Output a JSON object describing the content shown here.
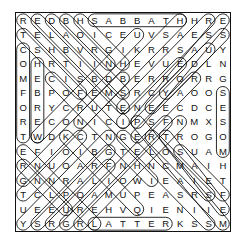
{
  "puzzle": {
    "type": "word-search",
    "rows": 15,
    "cols": 15,
    "grid": [
      [
        "R",
        "E",
        "D",
        "B",
        "H",
        "S",
        "A",
        "B",
        "B",
        "A",
        "T",
        "H",
        "H",
        "R",
        "E"
      ],
      [
        "T",
        "E",
        "L",
        "A",
        "O",
        "I",
        "C",
        "E",
        "U",
        "V",
        "S",
        "A",
        "E",
        "S",
        "S"
      ],
      [
        "C",
        "S",
        "H",
        "B",
        "V",
        "R",
        "G",
        "I",
        "K",
        "R",
        "R",
        "S",
        "A",
        "U",
        "Y"
      ],
      [
        "O",
        "H",
        "R",
        "T",
        "I",
        "I",
        "N",
        "H",
        "E",
        "V",
        "U",
        "E",
        "D",
        "L",
        "N"
      ],
      [
        "M",
        "E",
        "C",
        "I",
        "S",
        "B",
        "D",
        "B",
        "E",
        "R",
        "R",
        "O",
        "R",
        "R",
        "G"
      ],
      [
        "F",
        "B",
        "P",
        "O",
        "F",
        "E",
        "M",
        "S",
        "R",
        "C",
        "Y",
        "A",
        "O",
        "O",
        "S"
      ],
      [
        "O",
        "R",
        "Y",
        "C",
        "R",
        "U",
        "T",
        "E",
        "N",
        "E",
        "E",
        "C",
        "D",
        "C",
        "E"
      ],
      [
        "R",
        "E",
        "C",
        "O",
        "N",
        "I",
        "C",
        "I",
        "P",
        "S",
        "F",
        "N",
        "M",
        "X",
        "S"
      ],
      [
        "T",
        "W",
        "D",
        "K",
        "C",
        "T",
        "N",
        "G",
        "E",
        "R",
        "T",
        "R",
        "O",
        "G",
        "O"
      ],
      [
        "E",
        "F",
        "I",
        "O",
        "I",
        "B",
        "G",
        "T",
        "E",
        "L",
        "O",
        "S",
        "U",
        "A",
        "M"
      ],
      [
        "R",
        "N",
        "U",
        "O",
        "A",
        "R",
        "F",
        "N",
        "H",
        "N",
        "C",
        "M",
        "A",
        "I",
        "H"
      ],
      [
        "G",
        "N",
        "N",
        "R",
        "A",
        "L",
        "I",
        "O",
        "W",
        "I",
        "E",
        "A",
        "I",
        "E",
        "T"
      ],
      [
        "T",
        "C",
        "L",
        "P",
        "O",
        "A",
        "M",
        "U",
        "P",
        "E",
        "A",
        "S",
        "R",
        "S",
        "F"
      ],
      [
        "U",
        "E",
        "E",
        "U",
        "R",
        "E",
        "H",
        "V",
        "Q",
        "I",
        "E",
        "N",
        "I",
        "I",
        "E"
      ],
      [
        "Y",
        "S",
        "R",
        "G",
        "R",
        "L",
        "A",
        "T",
        "T",
        "E",
        "R",
        "K",
        "S",
        "S",
        "M"
      ]
    ],
    "highlights": [
      {
        "word": "SABBATH",
        "start": [
          0,
          5
        ],
        "end": [
          0,
          11
        ]
      },
      {
        "word": "LATTER",
        "start": [
          14,
          5
        ],
        "end": [
          14,
          10
        ]
      },
      {
        "word": "COMFORT",
        "start": [
          2,
          0
        ],
        "end": [
          8,
          0
        ]
      },
      {
        "word": "HEBREW",
        "start": [
          3,
          1
        ],
        "end": [
          8,
          1
        ]
      },
      {
        "word": "MOSES",
        "start": [
          9,
          14
        ],
        "end": [
          5,
          14
        ]
      }
    ],
    "diagonal_highlights_down_right": [
      {
        "start": [
          0,
          0
        ],
        "end": [
          7,
          7
        ]
      },
      {
        "start": [
          0,
          1
        ],
        "end": [
          6,
          7
        ]
      },
      {
        "start": [
          0,
          2
        ],
        "end": [
          5,
          7
        ]
      },
      {
        "start": [
          0,
          3
        ],
        "end": [
          3,
          6
        ]
      },
      {
        "start": [
          0,
          4
        ],
        "end": [
          3,
          7
        ]
      },
      {
        "start": [
          1,
          0
        ],
        "end": [
          5,
          4
        ]
      },
      {
        "start": [
          4,
          2
        ],
        "end": [
          11,
          9
        ]
      },
      {
        "start": [
          8,
          3
        ],
        "end": [
          13,
          8
        ]
      },
      {
        "start": [
          9,
          0
        ],
        "end": [
          14,
          5
        ]
      },
      {
        "start": [
          8,
          7
        ],
        "end": [
          14,
          13
        ]
      },
      {
        "start": [
          7,
          8
        ],
        "end": [
          14,
          14
        ]
      },
      {
        "start": [
          8,
          9
        ],
        "end": [
          12,
          13
        ]
      },
      {
        "start": [
          8,
          10
        ],
        "end": [
          13,
          14
        ]
      },
      {
        "start": [
          9,
          11
        ],
        "end": [
          12,
          14
        ]
      },
      {
        "start": [
          10,
          0
        ],
        "end": [
          13,
          3
        ]
      }
    ],
    "diagonal_highlights_up_right": [
      {
        "start": [
          14,
          0
        ],
        "end": [
          8,
          6
        ]
      },
      {
        "start": [
          14,
          1
        ],
        "end": [
          9,
          6
        ]
      },
      {
        "start": [
          14,
          2
        ],
        "end": [
          10,
          6
        ]
      },
      {
        "start": [
          14,
          3
        ],
        "end": [
          7,
          10
        ]
      },
      {
        "start": [
          14,
          4
        ],
        "end": [
          7,
          11
        ]
      },
      {
        "start": [
          11,
          0
        ],
        "end": [
          4,
          7
        ]
      },
      {
        "start": [
          12,
          0
        ],
        "end": [
          8,
          4
        ]
      },
      {
        "start": [
          8,
          1
        ],
        "end": [
          1,
          8
        ]
      },
      {
        "start": [
          7,
          4
        ],
        "end": [
          0,
          11
        ]
      },
      {
        "start": [
          6,
          7
        ],
        "end": [
          0,
          13
        ]
      },
      {
        "start": [
          7,
          8
        ],
        "end": [
          0,
          14
        ]
      },
      {
        "start": [
          6,
          9
        ],
        "end": [
          1,
          14
        ]
      },
      {
        "start": [
          5,
          10
        ],
        "end": [
          2,
          13
        ]
      },
      {
        "start": [
          7,
          7
        ],
        "end": [
          3,
          11
        ]
      },
      {
        "start": [
          8,
          8
        ],
        "end": [
          4,
          12
        ]
      }
    ]
  }
}
